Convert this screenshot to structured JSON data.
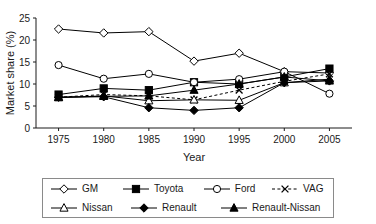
{
  "chart_data": {
    "type": "line",
    "title": "",
    "xlabel": "Year",
    "ylabel": "Market share (%)",
    "x": [
      1975,
      1980,
      1985,
      1990,
      1995,
      2000,
      2005
    ],
    "xticklabels": [
      "1975",
      "1980",
      "1985",
      "1990",
      "1995",
      "2000",
      "2005"
    ],
    "yticklabels": [
      "0",
      "5",
      "10",
      "15",
      "20",
      "25"
    ],
    "yticks": [
      0,
      5,
      10,
      15,
      20,
      25
    ],
    "xlim": [
      1972.5,
      2007.5
    ],
    "ylim": [
      0,
      25
    ],
    "grid": false,
    "legend_position": "bottom",
    "series": [
      {
        "name": "GM",
        "marker": "open-diamond",
        "linestyle": "solid",
        "color": "#000000",
        "values": [
          22.5,
          21.6,
          21.9,
          15.2,
          17.0,
          12.8,
          12.5
        ]
      },
      {
        "name": "Toyota",
        "marker": "filled-square",
        "linestyle": "solid",
        "color": "#000000",
        "values": [
          7.6,
          9.0,
          8.6,
          10.4,
          10.0,
          11.6,
          13.5
        ]
      },
      {
        "name": "Ford",
        "marker": "open-circle",
        "linestyle": "solid",
        "color": "#000000",
        "values": [
          14.3,
          11.2,
          12.3,
          10.4,
          11.1,
          12.8,
          7.8
        ]
      },
      {
        "name": "VAG",
        "marker": "cross-x",
        "linestyle": "dashed",
        "color": "#000000",
        "values": [
          7.0,
          7.6,
          7.3,
          6.4,
          8.6,
          10.6,
          12.3
        ]
      },
      {
        "name": "Nissan",
        "marker": "open-triangle",
        "linestyle": "solid",
        "color": "#000000",
        "values": [
          6.9,
          7.3,
          6.2,
          6.4,
          6.3,
          10.3,
          11.1
        ]
      },
      {
        "name": "Renault",
        "marker": "filled-diamond",
        "linestyle": "solid",
        "color": "#000000",
        "values": [
          7.0,
          7.1,
          4.6,
          4.0,
          4.6,
          10.3,
          10.7
        ]
      },
      {
        "name": "Renault-Nissan",
        "marker": "filled-triangle",
        "linestyle": "solid",
        "color": "#000000",
        "values": [
          7.0,
          7.2,
          7.3,
          8.6,
          10.0,
          11.6,
          10.7
        ]
      }
    ]
  },
  "legend": {
    "rows": [
      [
        {
          "label": "GM",
          "marker": "open-diamond",
          "linestyle": "solid"
        },
        {
          "label": "Toyota",
          "marker": "filled-square",
          "linestyle": "solid"
        },
        {
          "label": "Ford",
          "marker": "open-circle",
          "linestyle": "solid"
        },
        {
          "label": "VAG",
          "marker": "cross-x",
          "linestyle": "dashed"
        }
      ],
      [
        {
          "label": "Nissan",
          "marker": "open-triangle",
          "linestyle": "solid"
        },
        {
          "label": "Renault",
          "marker": "filled-diamond",
          "linestyle": "solid"
        },
        {
          "label": "Renault-Nissan",
          "marker": "filled-triangle",
          "linestyle": "solid"
        }
      ]
    ]
  }
}
